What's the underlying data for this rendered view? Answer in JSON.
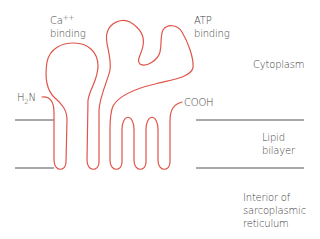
{
  "labels": {
    "ca_binding": {
      "line1": "Ca",
      "sup": "++",
      "line2": "binding"
    },
    "atp_binding": {
      "line1": "ATP",
      "line2": "binding"
    },
    "cytoplasm": "Cytoplasm",
    "n_terminus": {
      "prefix": "H",
      "sub": "2",
      "suffix": "N"
    },
    "c_terminus": "COOH",
    "lipid_bilayer": {
      "line1": "Lipid",
      "line2": "bilayer"
    },
    "interior": {
      "line1": "Interior of",
      "line2": "sarcoplasmic",
      "line3": "reticulum"
    }
  },
  "colors": {
    "protein": "#e0544a",
    "membrane": "#555555",
    "text": "#444444"
  }
}
